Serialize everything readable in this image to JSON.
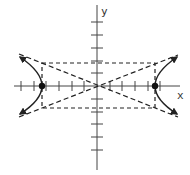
{
  "diagram": {
    "type": "hyperbola-graph",
    "axes": {
      "x_label": "x",
      "y_label": "y",
      "x_ticks": [
        -6,
        -5,
        -4,
        -3,
        -2,
        -1,
        1,
        2,
        3,
        4,
        5,
        6
      ],
      "y_ticks": [
        -5,
        -4,
        -3,
        -2,
        -1,
        1,
        2,
        3,
        4,
        5
      ]
    },
    "hyperbola": {
      "orientation": "horizontal",
      "vertices": [
        [
          -4.5,
          0
        ],
        [
          4.5,
          0
        ]
      ],
      "a": 4.5,
      "b": 1.8
    },
    "fundamental_rectangle": {
      "x_min": -4.5,
      "x_max": 4.5,
      "y_min": -1.8,
      "y_max": 1.8,
      "style": "dashed"
    },
    "asymptotes": {
      "style": "dashed",
      "slopes": [
        0.4,
        -0.4
      ]
    },
    "colors": {
      "stroke": "#222222",
      "background": "#ffffff"
    }
  }
}
